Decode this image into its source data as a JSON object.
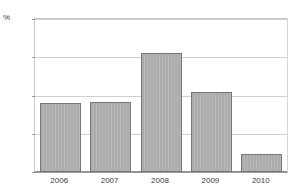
{
  "chart_data": {
    "type": "bar",
    "title": "",
    "xlabel": "",
    "ylabel": "%",
    "categories": [
      "2006",
      "2007",
      "2008",
      "2009",
      "2010"
    ],
    "values": [
      9.0,
      9.2,
      15.5,
      10.5,
      2.4
    ],
    "ylim": [
      0,
      20
    ],
    "yticks": [
      0,
      5,
      10,
      15,
      20
    ],
    "ytick_labels": [
      "0",
      "5",
      "10",
      "15",
      "20"
    ],
    "grid": "horizontal",
    "legend": "none",
    "bar_color": "#ababab",
    "bar_border_color": "#777777",
    "gridline_color": "#cfcfcf",
    "axis_color": "#8f8f8f"
  },
  "axis": {
    "unit_label": "%"
  },
  "title_clipped": {
    "text": "Inflation",
    "note": "cropped at top edge, illegible"
  }
}
